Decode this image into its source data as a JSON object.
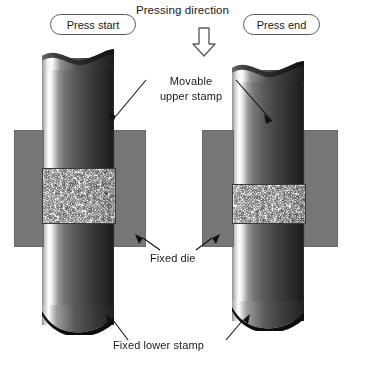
{
  "header": {
    "pressing_direction": "Pressing direction",
    "arrow_icon": "down-block-arrow-icon"
  },
  "stages": {
    "left": {
      "pill_label": "Press start"
    },
    "right": {
      "pill_label": "Press end"
    }
  },
  "annotations": {
    "movable_upper_stamp": "Movable\nupper stamp",
    "movable_upper_stamp_line1": "Movable",
    "movable_upper_stamp_line2": "upper stamp",
    "fixed_die": "Fixed die",
    "fixed_lower_stamp": "Fixed lower stamp"
  },
  "colors": {
    "die_gray": "#767676",
    "powder_fill": "#fcfcfc",
    "outline": "#3a3a3a",
    "pill_border": "#5a5a5a",
    "text": "#1a1a1a",
    "cylinder_highlight": "#ffffff",
    "cylinder_dark": "#1b1b1b"
  },
  "geometry": {
    "left": {
      "upper_stamp_top_y": 50,
      "powder_top_y": 168,
      "powder_bottom_y": 222,
      "powder_height": 54,
      "die_top_y": 130,
      "die_bottom_y": 245
    },
    "right": {
      "upper_stamp_top_y": 62,
      "powder_top_y": 184,
      "powder_bottom_y": 222,
      "powder_height": 38,
      "die_top_y": 130,
      "die_bottom_y": 245
    }
  }
}
